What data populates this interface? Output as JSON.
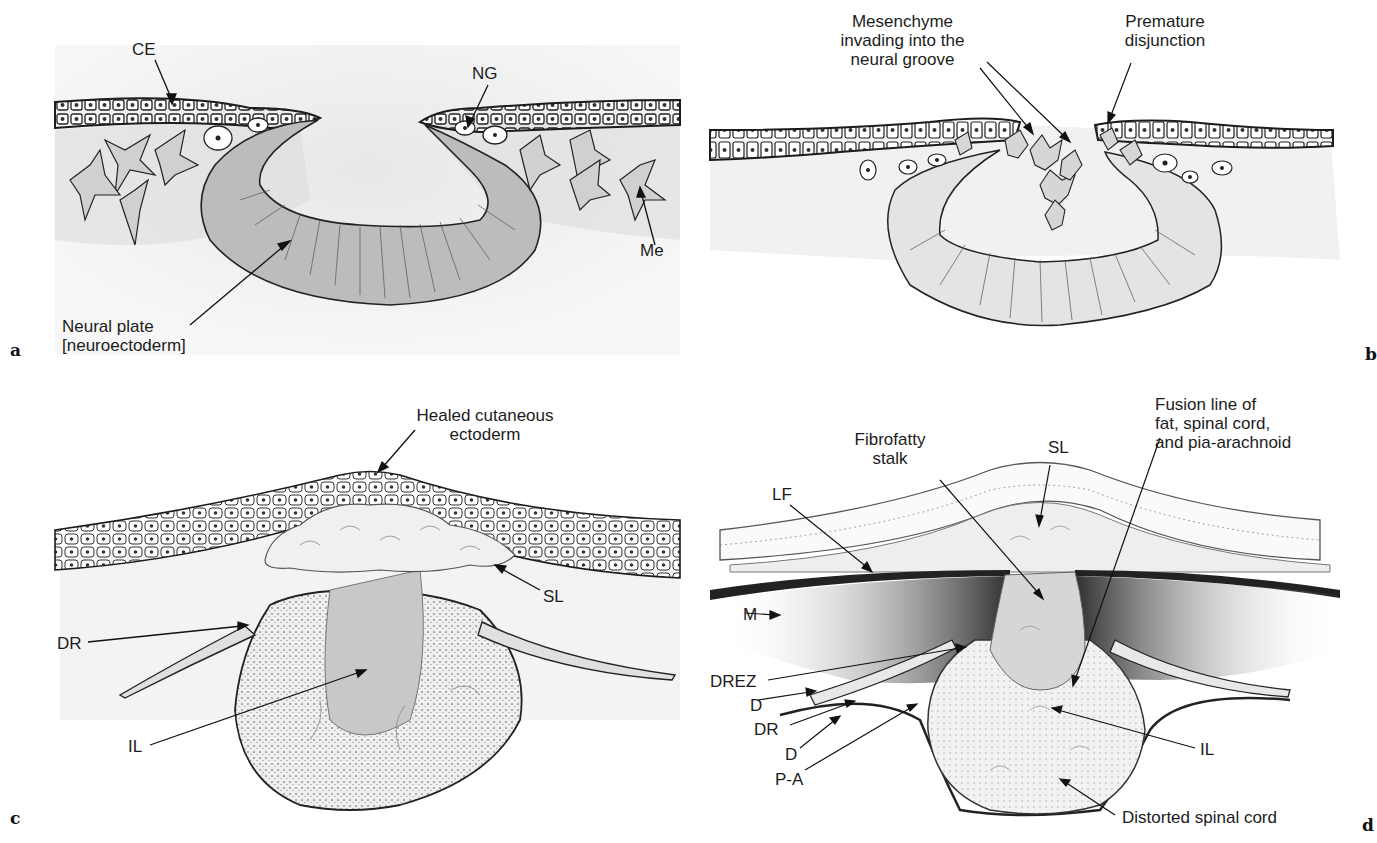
{
  "figure": {
    "panels": [
      {
        "letter": "a",
        "labels": {
          "ce": "CE",
          "ng": "NG",
          "me": "Me",
          "neural_plate": "Neural plate\n[neuroectoderm]"
        }
      },
      {
        "letter": "b",
        "labels": {
          "mesenchyme": "Mesenchyme\ninvading into the\nneural groove",
          "premature": "Premature\ndisjunction"
        }
      },
      {
        "letter": "c",
        "labels": {
          "healed": "Healed cutaneous\nectoderm",
          "sl": "SL",
          "dr": "DR",
          "il": "IL"
        }
      },
      {
        "letter": "d",
        "labels": {
          "fibrofatty": "Fibrofatty\nstalk",
          "sl": "SL",
          "fusion": "Fusion line of\nfat, spinal cord,\nand pia-arachnoid",
          "lf": "LF",
          "m": "M",
          "drez": "DREZ",
          "d1": "D",
          "dr": "DR",
          "d2": "D",
          "pa": "P-A",
          "il": "IL",
          "distorted": "Distorted spinal cord"
        }
      }
    ],
    "colors": {
      "ink": "#1c1c1c",
      "tissue_shade": "#c8c8c8",
      "light_shade": "#e6e6e6",
      "muscle_dark": "#3a3a3a"
    }
  }
}
